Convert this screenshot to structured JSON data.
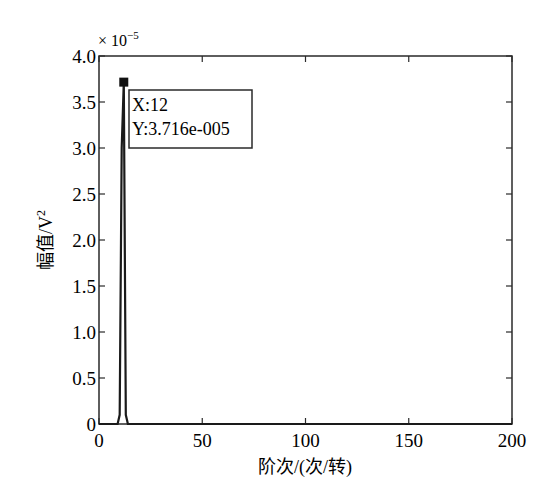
{
  "chart_data": {
    "type": "line",
    "title": "",
    "xlabel": "阶次/(次/转)",
    "ylabel": "幅值/V²",
    "ylabel_base": "幅值/V",
    "ylabel_sup": "2",
    "y_multiplier": "× 10",
    "y_multiplier_exp": "−5",
    "xlim": [
      0,
      200
    ],
    "ylim": [
      0,
      4e-05
    ],
    "xticks": [
      0,
      50,
      100,
      150,
      200
    ],
    "xtick_labels": [
      "0",
      "50",
      "100",
      "150",
      "200"
    ],
    "yticks": [
      0,
      0.5,
      1.0,
      1.5,
      2.0,
      2.5,
      3.0,
      3.5,
      4.0
    ],
    "ytick_labels": [
      "0",
      "0.5",
      "1.0",
      "1.5",
      "2.0",
      "2.5",
      "3.0",
      "3.5",
      "4.0"
    ],
    "grid": false,
    "series": [
      {
        "name": "order spectrum",
        "color": "#1a1a1a",
        "x": [
          0,
          8,
          9,
          10,
          11,
          12,
          13,
          14,
          20,
          50,
          100,
          150,
          200
        ],
        "y": [
          0,
          0,
          0,
          1e-06,
          3e-05,
          3.716e-05,
          1e-06,
          0,
          0,
          0,
          0,
          0,
          0
        ]
      }
    ],
    "annotations": [
      {
        "type": "datatip",
        "x": 12,
        "y": 3.716e-05,
        "line1": "X:12",
        "line2": "Y:3.716e-005"
      }
    ]
  }
}
